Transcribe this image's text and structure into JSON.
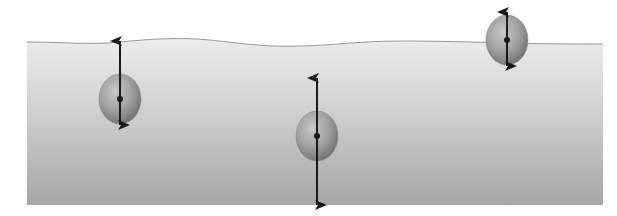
{
  "diagram": {
    "type": "buoyancy-force-diagram",
    "width": 617,
    "height": 216,
    "fluid": {
      "left": 27,
      "right": 603,
      "bottom": 205,
      "surface_path": "M27,42 C60,42 90,45 120,42 C150,39 180,37 210,40 C240,43 260,47 300,46 C340,45 360,41 400,41 C440,41 470,42 507,43 C540,44 570,44 603,44",
      "color_top": "#ececec",
      "color_bottom": "#a6a6a6",
      "surface_line_color": "#9a9a9a"
    },
    "objects": [
      {
        "name": "object-partially-sinking",
        "cx": 120,
        "cy": 99,
        "rx": 21,
        "ry": 25,
        "buoyant_force_tip_y": 41,
        "weight_force_tip_y": 125
      },
      {
        "name": "object-submerged",
        "cx": 317,
        "cy": 136,
        "rx": 21,
        "ry": 25,
        "buoyant_force_tip_y": 78,
        "weight_force_tip_y": 205
      },
      {
        "name": "object-floating",
        "cx": 507,
        "cy": 40,
        "rx": 21,
        "ry": 25,
        "buoyant_force_tip_y": 12,
        "weight_force_tip_y": 66
      }
    ],
    "colors": {
      "ball_light": "#c8c8c8",
      "ball_mid": "#a0a0a0",
      "ball_dark": "#6e6e6e",
      "arrow": "#1a1a1a"
    }
  }
}
